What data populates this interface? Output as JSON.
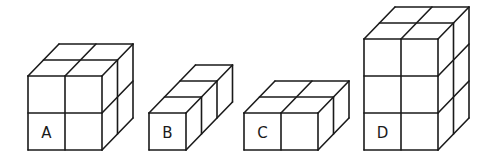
{
  "figure": {
    "unit_size_px": 37,
    "depth_offset_px": [
      15.5,
      -16
    ],
    "stroke_color": "#1a1a1a",
    "background": "#ffffff"
  },
  "shapes": [
    {
      "label": "A",
      "width": 2,
      "height": 2,
      "depth": 2,
      "origin": [
        28,
        150
      ]
    },
    {
      "label": "B",
      "width": 1,
      "height": 1,
      "depth": 3,
      "origin": [
        149,
        150
      ]
    },
    {
      "label": "C",
      "width": 2,
      "height": 1,
      "depth": 2,
      "origin": [
        244,
        150
      ]
    },
    {
      "label": "D",
      "width": 2,
      "height": 3,
      "depth": 2,
      "origin": [
        364,
        150
      ]
    }
  ]
}
